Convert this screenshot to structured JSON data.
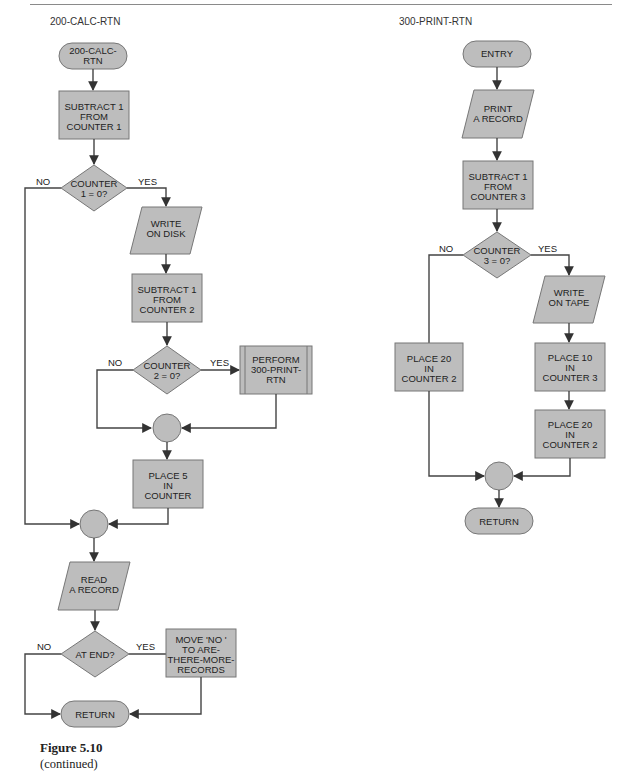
{
  "page": {
    "figure_caption": "Figure 5.10",
    "figure_subcaption": "(continued)"
  },
  "left_chart": {
    "title": "200-CALC-RTN",
    "entry": [
      "200-CALC-",
      "RTN"
    ],
    "sub1": [
      "SUBTRACT 1",
      "FROM",
      "COUNTER 1"
    ],
    "dec1": [
      "COUNTER",
      "1 = 0?"
    ],
    "dec1_no": "NO",
    "dec1_yes": "YES",
    "write_disk": [
      "WRITE",
      "ON DISK"
    ],
    "sub2": [
      "SUBTRACT 1",
      "FROM",
      "COUNTER 2"
    ],
    "dec2": [
      "COUNTER",
      "2 = 0?"
    ],
    "dec2_no": "NO",
    "dec2_yes": "YES",
    "perform": [
      "PERFORM",
      "300-PRINT-",
      "RTN"
    ],
    "place5": [
      "PLACE 5",
      "IN",
      "COUNTER"
    ],
    "read": [
      "READ",
      "A RECORD"
    ],
    "dec3": [
      "AT END?"
    ],
    "dec3_no": "NO",
    "dec3_yes": "YES",
    "move": [
      "MOVE 'NO '",
      "TO ARE-",
      "THERE-MORE-",
      "RECORDS"
    ],
    "return": "RETURN"
  },
  "right_chart": {
    "title": "300-PRINT-RTN",
    "entry": "ENTRY",
    "print": [
      "PRINT",
      "A RECORD"
    ],
    "sub3": [
      "SUBTRACT 1",
      "FROM",
      "COUNTER 3"
    ],
    "dec": [
      "COUNTER",
      "3 = 0?"
    ],
    "dec_no": "NO",
    "dec_yes": "YES",
    "write_tape": [
      "WRITE",
      "ON TAPE"
    ],
    "place20_left": [
      "PLACE 20",
      "IN",
      "COUNTER 2"
    ],
    "place10": [
      "PLACE 10",
      "IN",
      "COUNTER 3"
    ],
    "place20_right": [
      "PLACE 20",
      "IN",
      "COUNTER 2"
    ],
    "return": "RETURN"
  },
  "colors": {
    "shape_fill": "#bdbdbd",
    "shape_stroke": "#777777",
    "line": "#444444"
  }
}
